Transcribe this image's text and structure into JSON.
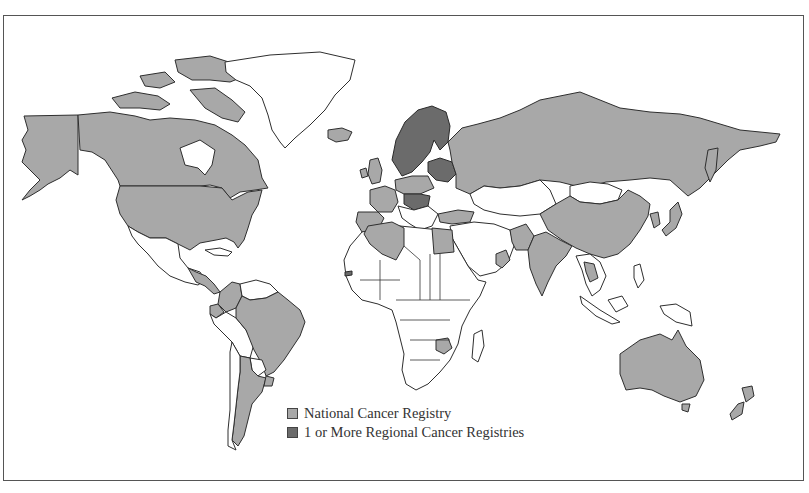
{
  "figure": {
    "type": "choropleth world map"
  },
  "legend": {
    "items": [
      {
        "label": "National Cancer Registry",
        "color": "#a8a8a8"
      },
      {
        "label": "1 or More Regional Cancer Registries",
        "color": "#6b6b6b"
      }
    ]
  },
  "colors": {
    "national": "#a8a8a8",
    "regional": "#6b6b6b",
    "none": "#ffffff",
    "outline": "#2e2e2e"
  },
  "regions": {
    "national": [
      "Canada",
      "United States",
      "Alaska",
      "Colombia",
      "Ecuador",
      "Brazil",
      "Argentina",
      "Uruguay",
      "Cuba",
      "Costa Rica",
      "Iceland",
      "Ireland",
      "United Kingdom",
      "France",
      "Spain",
      "Portugal",
      "Germany",
      "Austria",
      "Russia",
      "Turkey",
      "Algeria",
      "Egypt",
      "Oman",
      "Pakistan",
      "India",
      "China",
      "Japan",
      "South Korea",
      "Thailand",
      "Zimbabwe",
      "Australia",
      "New Zealand"
    ],
    "regional": [
      "Norway",
      "Sweden",
      "Finland",
      "Denmark",
      "Estonia",
      "Latvia",
      "Lithuania",
      "Belarus",
      "Czech Republic",
      "Slovakia",
      "Hungary",
      "Croatia",
      "Slovenia",
      "Bulgaria",
      "Gambia"
    ]
  }
}
